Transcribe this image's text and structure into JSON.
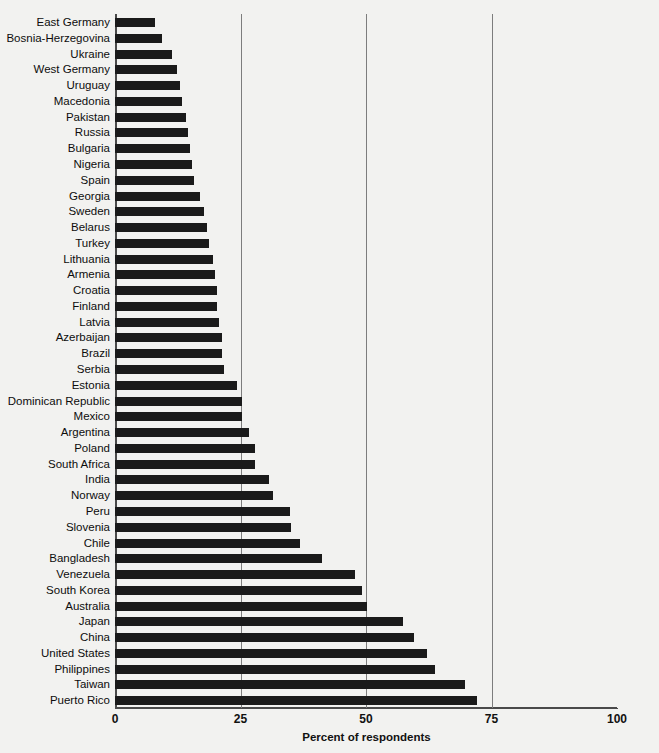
{
  "chart_data": {
    "type": "bar",
    "orientation": "horizontal",
    "title": "",
    "subtitle": "",
    "xlabel": "Percent of respondents",
    "ylabel": "",
    "xlim": [
      0,
      100
    ],
    "xticks": [
      0,
      25,
      50,
      75,
      100
    ],
    "xtick_labels": [
      "0",
      "25",
      "50",
      "75",
      "100"
    ],
    "grid": "vertical gridlines at 25, 50, 75",
    "legend": "none",
    "bar_color": "#1a1a1a",
    "background_color": "#f2f2f0",
    "categories": [
      "East Germany",
      "Bosnia-Herzegovina",
      "Ukraine",
      "West Germany",
      "Uruguay",
      "Macedonia",
      "Pakistan",
      "Russia",
      "Bulgaria",
      "Nigeria",
      "Spain",
      "Georgia",
      "Sweden",
      "Belarus",
      "Turkey",
      "Lithuania",
      "Armenia",
      "Croatia",
      "Finland",
      "Latvia",
      "Azerbaijan",
      "Brazil",
      "Serbia",
      "Estonia",
      "Dominican Republic",
      "Mexico",
      "Argentina",
      "Poland",
      "South Africa",
      "India",
      "Norway",
      "Peru",
      "Slovenia",
      "Chile",
      "Bangladesh",
      "Venezuela",
      "South Korea",
      "Australia",
      "Japan",
      "China",
      "United States",
      "Philippines",
      "Taiwan",
      "Puerto Rico"
    ],
    "values": [
      8.0,
      9.4,
      11.4,
      12.4,
      13.0,
      13.3,
      14.1,
      14.5,
      14.9,
      15.3,
      15.7,
      16.9,
      17.7,
      18.3,
      18.7,
      19.5,
      19.9,
      20.3,
      20.3,
      20.7,
      21.3,
      21.3,
      21.7,
      24.3,
      25.3,
      25.3,
      26.7,
      27.9,
      27.9,
      30.7,
      31.5,
      34.9,
      35.1,
      36.9,
      41.2,
      47.8,
      49.2,
      50.2,
      57.4,
      59.6,
      62.2,
      63.7,
      69.7,
      72.1
    ]
  }
}
